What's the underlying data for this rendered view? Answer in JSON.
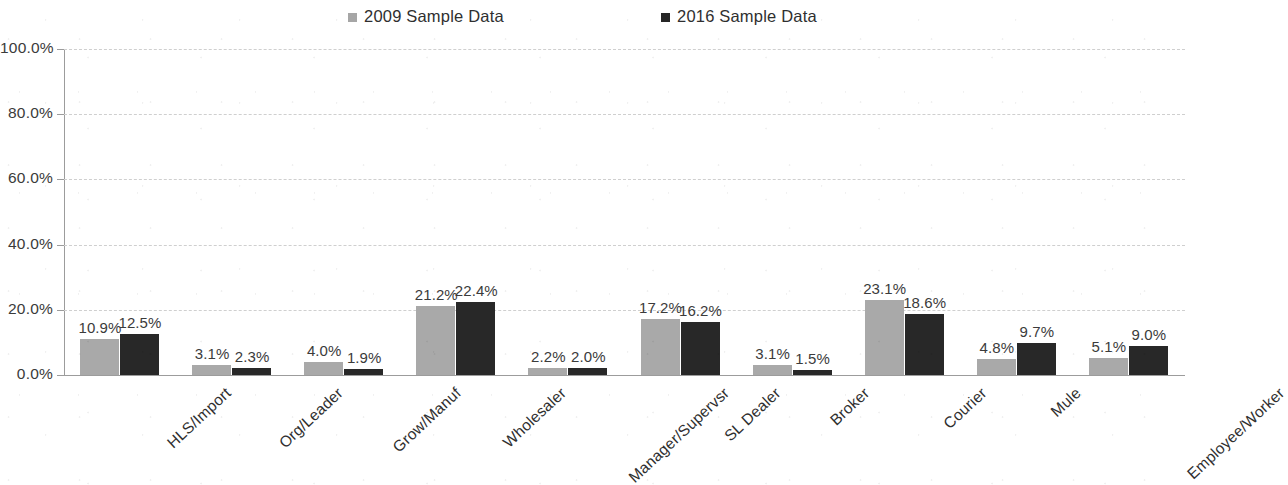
{
  "chart_data": {
    "type": "bar",
    "title": "",
    "xlabel": "",
    "ylabel": "",
    "ylim": [
      0,
      100
    ],
    "ytick_labels": [
      "100.0%",
      "80.0%",
      "60.0%",
      "40.0%",
      "20.0%",
      "0.0%"
    ],
    "ytick_values": [
      100,
      80,
      60,
      40,
      20,
      0
    ],
    "grid": "horizontal dashed gridlines",
    "legend_position": "top-center",
    "categories": [
      "HLS/Import",
      "Org/Leader",
      "Grow/Manuf",
      "Wholesaler",
      "Manager/Supervsr",
      "SL Dealer",
      "Broker",
      "Courier",
      "Mule",
      "Employee/Worker"
    ],
    "series": [
      {
        "name": "2009 Sample Data",
        "color": "#a9a9a9",
        "values": [
          10.9,
          3.1,
          4.0,
          21.2,
          2.2,
          17.2,
          3.1,
          23.1,
          4.8,
          5.1
        ],
        "labels": [
          "10.9%",
          "3.1%",
          "4.0%",
          "21.2%",
          "2.2%",
          "17.2%",
          "3.1%",
          "23.1%",
          "4.8%",
          "5.1%"
        ]
      },
      {
        "name": "2016 Sample Data",
        "color": "#282828",
        "values": [
          12.5,
          2.3,
          1.9,
          22.4,
          2.0,
          16.2,
          1.5,
          18.6,
          9.7,
          9.0
        ],
        "labels": [
          "12.5%",
          "2.3%",
          "1.9%",
          "22.4%",
          "2.0%",
          "16.2%",
          "1.5%",
          "18.6%",
          "9.7%",
          "9.0%"
        ]
      }
    ]
  },
  "legend": {
    "items": [
      {
        "label": "2009 Sample Data",
        "marker": "square-marker",
        "color": "#a6a6a6"
      },
      {
        "label": "2016 Sample Data",
        "marker": "square-marker",
        "color": "#262626"
      }
    ]
  }
}
